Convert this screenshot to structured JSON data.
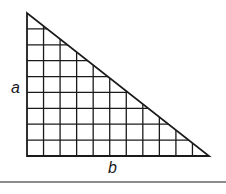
{
  "figure": {
    "type": "right-triangle-grid",
    "labels": {
      "vertical_leg": "a",
      "horizontal_leg": "b"
    },
    "grid": {
      "columns": 11,
      "rows": 9
    },
    "geometry": {
      "apex": [
        27,
        13
      ],
      "right_angle_corner": [
        27,
        156
      ],
      "base_vertex": [
        209,
        156
      ],
      "rule_y": 182
    },
    "colors": {
      "stroke": "#1a1a1a",
      "background": "#ffffff"
    }
  }
}
